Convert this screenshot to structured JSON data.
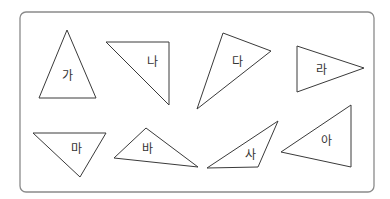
{
  "frame": {
    "x": 20,
    "y": 12,
    "width": 354,
    "height": 180,
    "radius": 6,
    "stroke": "#8a8a8a"
  },
  "triangles": [
    {
      "label": "가",
      "points": "67,30 39,98 96,98",
      "label_pos": [
        67,
        76
      ]
    },
    {
      "label": "나",
      "points": "106,42 169,42 169,105",
      "label_pos": [
        152,
        62
      ]
    },
    {
      "label": "다",
      "points": "223,33 271,51 197,109",
      "label_pos": [
        237,
        62
      ]
    },
    {
      "label": "라",
      "points": "297,46 364,68 297,92",
      "label_pos": [
        321,
        70
      ]
    },
    {
      "label": "마",
      "points": "33,133 106,133 80,177",
      "label_pos": [
        76,
        149
      ]
    },
    {
      "label": "바",
      "points": "146,128 114,158 198,167",
      "label_pos": [
        147,
        149
      ]
    },
    {
      "label": "사",
      "points": "278,121 207,168 258,167",
      "label_pos": [
        250,
        155
      ]
    },
    {
      "label": "아",
      "points": "351,105 351,167 281,152",
      "label_pos": [
        326,
        141
      ]
    }
  ]
}
